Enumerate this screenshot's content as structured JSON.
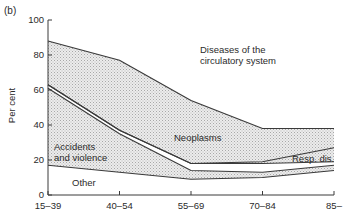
{
  "panel_label": "(b)",
  "chart_data": {
    "type": "area",
    "stacked": true,
    "title": "",
    "xlabel": "",
    "ylabel": "Per cent",
    "ylim": [
      0,
      100
    ],
    "yticks": [
      0,
      20,
      40,
      60,
      80,
      100
    ],
    "categories": [
      "15–39",
      "40–54",
      "55–69",
      "70–84",
      "85–"
    ],
    "boundaries": {
      "other_top": [
        17,
        13,
        9,
        10,
        14
      ],
      "accidents_top": [
        61,
        35,
        14,
        13,
        17
      ],
      "neoplasms_bottom": [
        63,
        37,
        18,
        18,
        19
      ],
      "resp_dis_top": [
        63,
        37,
        18,
        19,
        27
      ],
      "circulatory_bottom": [
        88,
        77,
        54,
        38,
        38
      ]
    },
    "series": [
      {
        "name": "Other",
        "values": [
          17,
          13,
          9,
          10,
          14
        ]
      },
      {
        "name": "Accidents and violence",
        "values": [
          44,
          22,
          5,
          3,
          3
        ]
      },
      {
        "name": "Neoplasms",
        "values": [
          25,
          40,
          36,
          19,
          11
        ]
      },
      {
        "name": "Resp. dis.",
        "values": [
          0,
          0,
          0,
          1,
          8
        ]
      },
      {
        "name": "Diseases of the circulatory system",
        "values": [
          12,
          23,
          46,
          62,
          62
        ]
      }
    ],
    "annotations": [
      {
        "text": "Diseases of the circulatory system",
        "position": "upper right"
      },
      {
        "text": "Neoplasms",
        "position": "middle"
      },
      {
        "text": "Accidents and violence",
        "position": "lower left"
      },
      {
        "text": "Resp. dis.",
        "position": "lower right"
      },
      {
        "text": "Other",
        "position": "bottom left"
      }
    ],
    "grid": false,
    "legend": "none (inline labels)"
  },
  "labels": {
    "circulatory_line1": "Diseases of the",
    "circulatory_line2": "circulatory system",
    "neoplasms": "Neoplasms",
    "accidents_line1": "Accidents",
    "accidents_line2": "and violence",
    "resp": "Resp. dis.",
    "other": "Other",
    "ylabel": "Per cent"
  }
}
